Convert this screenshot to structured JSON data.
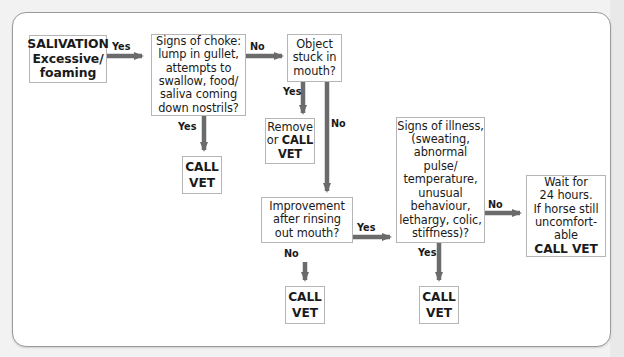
{
  "diagram": {
    "type": "flowchart",
    "accent_colors": {
      "arrow": "#6b6b6b",
      "box_border": "#b5b5b5",
      "panel_border": "#9a9a9a",
      "background": "#f2f2f2"
    },
    "nodes": {
      "start": {
        "lines": [
          "SALIVATION",
          "Excessive/",
          "foaming"
        ]
      },
      "choke": {
        "lines": [
          "Signs of choke:",
          "lump in gullet,",
          "attempts to",
          "swallow, food/",
          "saliva coming",
          "down nostrils?"
        ]
      },
      "object": {
        "lines": [
          "Object",
          "stuck in",
          "mouth?"
        ]
      },
      "remove": {
        "line1": "Remove",
        "line2_prefix": "or ",
        "line2_bold": "CALL",
        "line3": "VET"
      },
      "vet1": {
        "lines": [
          "CALL",
          "VET"
        ]
      },
      "improvement": {
        "lines": [
          "Improvement",
          "after rinsing",
          "out mouth?"
        ]
      },
      "illness": {
        "lines": [
          "Signs of illness,",
          "(sweating,",
          "abnormal",
          "pulse/",
          "temperature,",
          "unusual",
          "behaviour,",
          "lethargy, colic,",
          "stiffness)?"
        ]
      },
      "wait": {
        "lines": [
          "Wait for",
          "24 hours.",
          "If horse still",
          "uncomfort-",
          "able"
        ],
        "bold_line": "CALL VET"
      },
      "vet2": {
        "lines": [
          "CALL",
          "VET"
        ]
      },
      "vet3": {
        "lines": [
          "CALL",
          "VET"
        ]
      }
    },
    "edges": [
      {
        "from": "start",
        "to": "choke",
        "label": "Yes"
      },
      {
        "from": "choke",
        "to": "object",
        "label": "No"
      },
      {
        "from": "choke",
        "to": "vet1",
        "label": "Yes"
      },
      {
        "from": "object",
        "to": "remove",
        "label": "Yes"
      },
      {
        "from": "object",
        "to": "improvement",
        "label": "No"
      },
      {
        "from": "improvement",
        "to": "illness",
        "label": "Yes"
      },
      {
        "from": "improvement",
        "to": "vet2",
        "label": "No"
      },
      {
        "from": "illness",
        "to": "wait",
        "label": "No"
      },
      {
        "from": "illness",
        "to": "vet3",
        "label": "Yes"
      }
    ]
  }
}
